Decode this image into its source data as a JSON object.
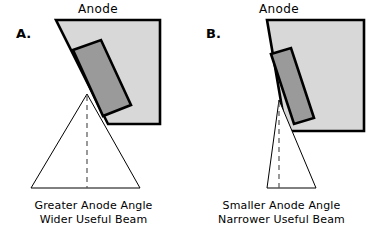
{
  "figure": {
    "background_color": "#ffffff",
    "anode_fill_color": "#d8d8d8",
    "focal_track_fill_color": "#9a9a9a",
    "outline_color": "#000000",
    "beam_fill_color": "#ffffff"
  },
  "panels": [
    {
      "letter": "A.",
      "anode_label": "Anode",
      "caption_line1": "Greater Anode Angle",
      "caption_line2": "Wider Useful Beam",
      "anode_outline_points": "56,20 160,20 160,124 108,124 56,20",
      "anode_polygon": "56,20 160,20 160,124 108,124",
      "focal_track_points": "73,50 101,40 131,105 103,116",
      "beam_polygon": "87,94 140,188 31,188",
      "beam_center_x": 87,
      "beam_apex_y": 94,
      "beam_base_y": 188,
      "beam_base_left_x": 31,
      "beam_base_right_x": 140
    },
    {
      "letter": "B.",
      "anode_label": "Anode",
      "caption_line1": "Smaller Anode Angle",
      "caption_line2": "Narrower Useful Beam",
      "anode_outline_points": "79,20 176,20 176,131 98,131 79,20",
      "anode_polygon": "79,20 176,20 176,131 98,131",
      "focal_track_points": "83,54 103,48 126,118 106,124",
      "beam_polygon": "91,100 128,188 79,188",
      "beam_center_x": 91,
      "beam_apex_y": 100,
      "beam_base_y": 188,
      "beam_base_left_x": 79,
      "beam_base_right_x": 128
    }
  ]
}
